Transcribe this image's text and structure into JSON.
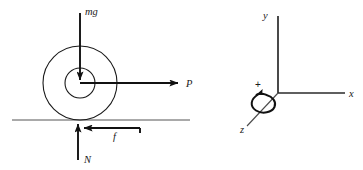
{
  "figure": {
    "background_color": "#ffffff",
    "line_color": "#1a1a1a",
    "width": 363,
    "height": 170
  },
  "free_body_diagram": {
    "name": "spool-free-body-diagram",
    "body": {
      "outer_circle": {
        "cx": 80,
        "cy": 83,
        "r": 37
      },
      "inner_circle": {
        "cx": 80,
        "cy": 83,
        "r": 15
      }
    },
    "ground_line": {
      "x1": 12,
      "y1": 120,
      "x2": 190,
      "y2": 120
    },
    "forces": [
      {
        "symbol": "mg",
        "name": "weight-force",
        "direction": "down",
        "label_x": 85,
        "label_y": 15,
        "arrow": {
          "x1": 80,
          "y1": 13,
          "x2": 80,
          "y2": 80
        }
      },
      {
        "symbol": "P",
        "name": "applied-force",
        "direction": "right",
        "label_x": 186,
        "label_y": 87,
        "arrow": {
          "x1": 80,
          "y1": 83,
          "x2": 178,
          "y2": 83
        }
      },
      {
        "symbol": "f",
        "name": "friction-force",
        "direction": "left",
        "label_x": 113,
        "label_y": 140,
        "arrow": {
          "x1": 140,
          "y1": 128,
          "x2": 84,
          "y2": 128
        }
      },
      {
        "symbol": "N",
        "name": "normal-force",
        "direction": "up",
        "label_x": 84,
        "label_y": 163,
        "arrow": {
          "x1": 78,
          "y1": 160,
          "x2": 78,
          "y2": 124
        }
      }
    ]
  },
  "coordinate_system": {
    "name": "coordinate-axes",
    "origin": {
      "x": 278,
      "y": 93
    },
    "axes": [
      {
        "symbol": "y",
        "name": "y-axis",
        "direction": "up",
        "end_x": 278,
        "end_y": 16,
        "label_x": 263,
        "label_y": 19
      },
      {
        "symbol": "x",
        "name": "x-axis",
        "direction": "right",
        "end_x": 345,
        "end_y": 93,
        "label_x": 349,
        "label_y": 97
      },
      {
        "symbol": "z",
        "name": "z-axis",
        "direction": "down-left",
        "end_x": 247,
        "end_y": 126,
        "label_x": 240,
        "label_y": 133
      }
    ],
    "rotation_indicator": {
      "symbol": "+",
      "name": "positive-rotation-sign",
      "label_x": 255,
      "label_y": 88,
      "sense": "counterclockwise-about-z"
    }
  }
}
